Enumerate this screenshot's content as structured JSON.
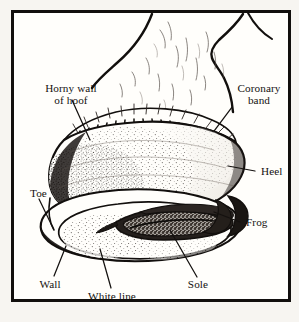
{
  "figure": {
    "background_color": "#f7f5f1",
    "frame_color": "#120f0d",
    "ink_color": "#14110f",
    "paper_color": "#fffefb"
  },
  "labels": {
    "horny_wall_line1": "Horny wall",
    "horny_wall_line2": "of hoof",
    "coronary_line1": "Coronary",
    "coronary_line2": "band",
    "heel": "Heel",
    "frog": "Frog",
    "sole": "Sole",
    "white_line": "White line",
    "wall": "Wall",
    "toe": "Toe"
  }
}
